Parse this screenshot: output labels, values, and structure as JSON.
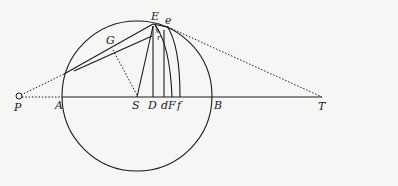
{
  "figure": {
    "type": "geometric-diagram",
    "labels": {
      "P": "P",
      "A": "A",
      "S": "S",
      "D": "D",
      "d": "d",
      "F": "F",
      "f": "f",
      "B": "B",
      "T": "T",
      "E": "E",
      "e": "e",
      "G": "G",
      "r": "r",
      "x": "x"
    },
    "points": {
      "P": [
        20,
        97
      ],
      "A": [
        62,
        97
      ],
      "S": [
        137,
        97
      ],
      "D": [
        153,
        97
      ],
      "d": [
        164,
        97
      ],
      "F": [
        172,
        97
      ],
      "f": [
        180,
        97
      ],
      "B": [
        212,
        97
      ],
      "T": [
        322,
        97
      ],
      "E": [
        153,
        22
      ],
      "e": [
        166,
        26
      ],
      "G": [
        112,
        46
      ]
    },
    "circle": {
      "center": [
        137,
        96
      ],
      "radius": 75
    }
  }
}
